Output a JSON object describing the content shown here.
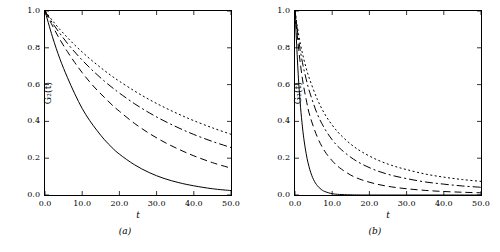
{
  "figure": {
    "background": "#ffffff",
    "axis_color": "#000000"
  },
  "panels": [
    {
      "caption": "(a)",
      "xlabel": "t",
      "ylabel": "G₂(t)"
    },
    {
      "caption": "(b)",
      "xlabel": "t",
      "ylabel": "G₂(t)"
    }
  ],
  "chart_data": [
    {
      "type": "line",
      "title": "",
      "subtitle": "(a)",
      "xlabel": "t",
      "ylabel": "G2(t)",
      "xlim": [
        0.0,
        50.0
      ],
      "ylim": [
        0.0,
        1.0
      ],
      "xticks": [
        0.0,
        10.0,
        20.0,
        30.0,
        40.0,
        50.0
      ],
      "xticklabels": [
        "0.0",
        "10.0",
        "20.0",
        "30.0",
        "40.0",
        "50.0"
      ],
      "yticks": [
        0.0,
        0.2,
        0.4,
        0.6,
        0.8,
        1.0
      ],
      "yticklabels": [
        "0.0",
        "0.2",
        "0.4",
        "0.6",
        "0.8",
        "1.0"
      ],
      "grid": false,
      "legend": "none",
      "series": [
        {
          "name": "curve-1-solid",
          "style": "solid",
          "x": [
            0,
            2,
            4,
            6,
            8,
            10,
            12,
            14,
            16,
            18,
            20,
            24,
            28,
            32,
            36,
            40,
            45,
            50
          ],
          "values": [
            1.0,
            0.86,
            0.74,
            0.64,
            0.55,
            0.47,
            0.405,
            0.35,
            0.3,
            0.258,
            0.222,
            0.165,
            0.122,
            0.09,
            0.067,
            0.05,
            0.034,
            0.024
          ]
        },
        {
          "name": "curve-2-dashed",
          "style": "dashed",
          "x": [
            0,
            2,
            4,
            6,
            8,
            10,
            12,
            14,
            16,
            18,
            20,
            24,
            28,
            32,
            36,
            40,
            45,
            50
          ],
          "values": [
            1.0,
            0.92,
            0.845,
            0.78,
            0.72,
            0.665,
            0.615,
            0.57,
            0.53,
            0.49,
            0.455,
            0.39,
            0.335,
            0.288,
            0.248,
            0.213,
            0.176,
            0.146
          ]
        },
        {
          "name": "curve-3-dashdot",
          "style": "dashdot",
          "x": [
            0,
            2,
            4,
            6,
            8,
            10,
            12,
            14,
            16,
            18,
            20,
            24,
            28,
            32,
            36,
            40,
            45,
            50
          ],
          "values": [
            1.0,
            0.935,
            0.878,
            0.825,
            0.777,
            0.733,
            0.692,
            0.654,
            0.618,
            0.585,
            0.554,
            0.497,
            0.447,
            0.403,
            0.364,
            0.329,
            0.291,
            0.258
          ]
        },
        {
          "name": "curve-4-dotted",
          "style": "dotted",
          "x": [
            0,
            2,
            4,
            6,
            8,
            10,
            12,
            14,
            16,
            18,
            20,
            24,
            28,
            32,
            36,
            40,
            45,
            50
          ],
          "values": [
            1.0,
            0.948,
            0.9,
            0.856,
            0.815,
            0.777,
            0.741,
            0.708,
            0.676,
            0.646,
            0.618,
            0.566,
            0.519,
            0.477,
            0.439,
            0.404,
            0.365,
            0.33
          ]
        }
      ]
    },
    {
      "type": "line",
      "title": "",
      "subtitle": "(b)",
      "xlabel": "t",
      "ylabel": "G2(t)",
      "xlim": [
        0.0,
        50.0
      ],
      "ylim": [
        0.0,
        1.0
      ],
      "xticks": [
        0.0,
        10.0,
        20.0,
        30.0,
        40.0,
        50.0
      ],
      "xticklabels": [
        "0.0",
        "10.0",
        "20.0",
        "30.0",
        "40.0",
        "50.0"
      ],
      "yticks": [
        0.0,
        0.2,
        0.4,
        0.6,
        0.8,
        1.0
      ],
      "yticklabels": [
        "0.0",
        "0.2",
        "0.4",
        "0.6",
        "0.8",
        "1.0"
      ],
      "grid": false,
      "legend": "none",
      "series": [
        {
          "name": "curve-1-solid",
          "style": "solid",
          "x": [
            0,
            1,
            2,
            3,
            4,
            5,
            6,
            7,
            8,
            10,
            12,
            15,
            20,
            30,
            40,
            50
          ],
          "values": [
            1.0,
            0.61,
            0.37,
            0.225,
            0.137,
            0.083,
            0.051,
            0.031,
            0.019,
            0.007,
            0.003,
            0.001,
            0.0,
            0.0,
            0.0,
            0.0
          ]
        },
        {
          "name": "curve-2-dashed",
          "style": "dashed",
          "x": [
            0,
            1,
            2,
            3,
            4,
            6,
            8,
            10,
            12,
            15,
            18,
            22,
            26,
            30,
            35,
            40,
            45,
            50
          ],
          "values": [
            1.0,
            0.79,
            0.63,
            0.52,
            0.43,
            0.315,
            0.238,
            0.186,
            0.148,
            0.108,
            0.082,
            0.059,
            0.044,
            0.034,
            0.025,
            0.019,
            0.015,
            0.012
          ]
        },
        {
          "name": "curve-3-dashdot",
          "style": "dashdot",
          "x": [
            0,
            1,
            2,
            3,
            4,
            6,
            8,
            10,
            12,
            15,
            18,
            22,
            26,
            30,
            35,
            40,
            45,
            50
          ],
          "values": [
            1.0,
            0.84,
            0.72,
            0.63,
            0.555,
            0.44,
            0.36,
            0.3,
            0.255,
            0.205,
            0.168,
            0.132,
            0.107,
            0.089,
            0.071,
            0.059,
            0.049,
            0.042
          ]
        },
        {
          "name": "curve-4-dotted",
          "style": "dotted",
          "x": [
            0,
            1,
            2,
            3,
            4,
            6,
            8,
            10,
            12,
            15,
            18,
            22,
            26,
            30,
            35,
            40,
            45,
            50
          ],
          "values": [
            1.0,
            0.87,
            0.77,
            0.69,
            0.625,
            0.52,
            0.44,
            0.38,
            0.332,
            0.276,
            0.234,
            0.192,
            0.161,
            0.138,
            0.114,
            0.097,
            0.084,
            0.074
          ]
        }
      ]
    }
  ]
}
